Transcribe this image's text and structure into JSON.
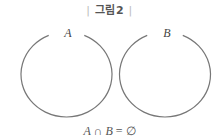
{
  "caption": {
    "left_bar": "|",
    "text": "그림2",
    "right_bar": "|"
  },
  "sets": [
    {
      "label": "A"
    },
    {
      "label": "B"
    }
  ],
  "formula": {
    "left": "A",
    "op": " ∩ ",
    "right": "B",
    "rest": " = ∅"
  },
  "colors": {
    "circle_stroke": "#777777",
    "text": "#555555"
  }
}
